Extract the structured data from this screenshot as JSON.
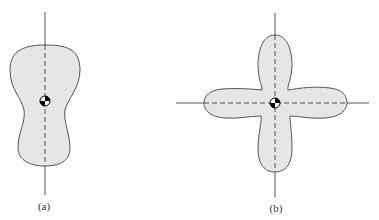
{
  "figures": [
    {
      "id": "a",
      "label": "(a)",
      "description": "Peanut-shaped body with vertical axis through centroid"
    },
    {
      "id": "b",
      "label": "(b)",
      "description": "Four-lobed cross-shaped body with vertical and horizontal axes through centroid"
    }
  ],
  "colors": {
    "fill": "#e6e6e6",
    "stroke": "#555555",
    "axis": "#444444"
  }
}
